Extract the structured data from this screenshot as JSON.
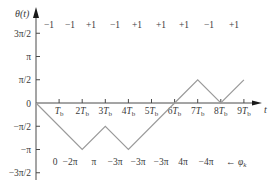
{
  "chart_data": {
    "type": "line",
    "title": "",
    "xlabel": "t",
    "ylabel": "θ(t)",
    "x_unit": "Tb",
    "x": [
      0,
      1,
      2,
      3,
      4,
      5,
      6,
      7,
      8,
      9
    ],
    "x_tick_labels": [
      "Tb",
      "2Tb",
      "3Tb",
      "4Tb",
      "5Tb",
      "6Tb",
      "7Tb",
      "8Tb",
      "9Tb"
    ],
    "y_tick_labels": [
      "3π/2",
      "π",
      "π/2",
      "0",
      "−π/2",
      "−π",
      "−3π/2"
    ],
    "y_tick_values_over_pi": [
      1.5,
      1.0,
      0.5,
      0,
      -0.5,
      -1.0,
      -1.5
    ],
    "ylim": [
      -1.5,
      1.5
    ],
    "series": [
      {
        "name": "θ(t) phase path",
        "x": [
          0,
          2,
          3,
          4,
          6,
          7,
          8,
          9
        ],
        "y_over_pi": [
          0,
          -1.0,
          -0.5,
          -1.0,
          0,
          0.5,
          0,
          0.5
        ]
      }
    ],
    "symbol_row": {
      "label": "data symbols",
      "values": [
        "−1",
        "−1",
        "+1",
        "−1",
        "+1",
        "+1",
        "+1",
        "−1",
        "+1"
      ]
    },
    "phase_row": {
      "label": "φk",
      "values": [
        "0",
        "−2π",
        "π",
        "−3π",
        "−3π",
        "−3π",
        "4π",
        "−4π"
      ],
      "arrow_label": "← φk"
    },
    "grid": false,
    "legend": "none"
  },
  "colors": {
    "axis": "#4a4a4a",
    "path": "#9a9a9a",
    "text": "#3a3a3a",
    "background": "#ffffff"
  }
}
